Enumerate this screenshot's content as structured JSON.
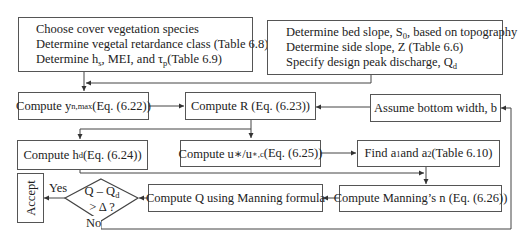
{
  "diagram": {
    "type": "flowchart",
    "title": "",
    "input_boxes": [
      {
        "id": "vegetation-inputs",
        "lines": [
          {
            "text": "Choose cover vegetation species"
          },
          {
            "text": "Determine vegetal retardance class (Table 6.8)"
          },
          {
            "pre": "Determine h",
            "sub": "s",
            "mid": ", MEI, and τ",
            "sub2": "p",
            "post": "(Table 6.9)"
          }
        ]
      },
      {
        "id": "channel-inputs",
        "lines": [
          {
            "pre": "Determine bed slope, S",
            "sub": "0",
            "post": ", based on topography"
          },
          {
            "text": "Determine side slope, Z (Table 6.6)"
          },
          {
            "pre": "Specify design peak discharge, Q",
            "sub": "d",
            "post": ""
          }
        ]
      }
    ],
    "steps": {
      "yn_max": {
        "pre": "Compute y",
        "sub": "n,max",
        "post": " (Eq. (6.22))"
      },
      "compute_r": {
        "text": "Compute R (Eq. (6.23))"
      },
      "assume_b": {
        "text": "Assume bottom width, b"
      },
      "compute_hd": {
        "pre": "Compute h",
        "sub": "d",
        "post": " (Eq. (6.24))"
      },
      "compute_u": {
        "pre": "Compute u∗/u",
        "sub": "∗,c",
        "post": " (Eq. (6.25))"
      },
      "find_a": {
        "pre": "Find a",
        "sub": "1",
        "mid": "and a",
        "sub2": "2",
        "post": " (Table 6.10)"
      },
      "manning_n": {
        "text": "Compute Manning’s n (Eq. (6.26))"
      },
      "compute_q": {
        "text": "Compute Q using Manning formula"
      }
    },
    "decision": {
      "line1_pre": "Q – Q",
      "line1_sub": "d",
      "line2": "> Δ ?",
      "yes_label": "Yes",
      "no_label": "No"
    },
    "terminal": {
      "text": "Accept"
    },
    "colors": {
      "line": "#444444",
      "box_border": "#555555",
      "background": "#ffffff"
    }
  }
}
